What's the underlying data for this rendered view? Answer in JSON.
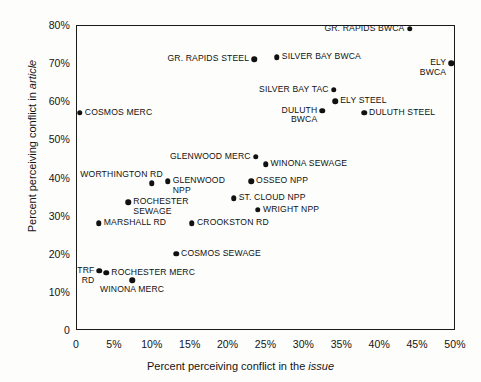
{
  "chart_data": {
    "type": "scatter",
    "title": "",
    "xlabel": "Percent perceiving conflict in the issue",
    "ylabel": "Percent perceiving conflict in article",
    "xlabel_plain": "Percent perceiving conflict in the",
    "xlabel_italic": "issue",
    "ylabel_plain": "Percent perceiving conflict in",
    "ylabel_italic": "article",
    "xlim": [
      0,
      50
    ],
    "ylim": [
      0,
      80
    ],
    "grid": false,
    "legend": "none",
    "xticks": [
      "0",
      "5%",
      "10%",
      "15%",
      "20%",
      "25%",
      "30%",
      "35%",
      "40%",
      "45%",
      "50%"
    ],
    "xtickvals": [
      0,
      5,
      10,
      15,
      20,
      25,
      30,
      35,
      40,
      45,
      50
    ],
    "yticks": [
      "0",
      "10%",
      "20%",
      "30%",
      "40%",
      "50%",
      "60%",
      "70%",
      "80%"
    ],
    "ytickvals": [
      0,
      10,
      20,
      30,
      40,
      50,
      60,
      70,
      80
    ],
    "marker_color": "#111111",
    "points": [
      {
        "label": "GR. RAPIDS BWCA",
        "x": 44.0,
        "y": 79.0,
        "pos": "l"
      },
      {
        "label": "GR. RAPIDS STEEL",
        "x": 23.5,
        "y": 71.0,
        "pos": "l"
      },
      {
        "label": "SILVER BAY BWCA",
        "x": 26.5,
        "y": 71.5,
        "pos": "r"
      },
      {
        "label": "ELY\nBWCA",
        "x": 49.5,
        "y": 70.0,
        "pos": "l2"
      },
      {
        "label": "SILVER BAY TAC",
        "x": 34.0,
        "y": 63.0,
        "pos": "l"
      },
      {
        "label": "ELY STEEL",
        "x": 34.2,
        "y": 60.0,
        "pos": "r"
      },
      {
        "label": "DULUTH\nBWCA",
        "x": 32.5,
        "y": 57.5,
        "pos": "l2"
      },
      {
        "label": "DULUTH STEEL",
        "x": 38.0,
        "y": 57.0,
        "pos": "r"
      },
      {
        "label": "COSMOS MERC",
        "x": 0.5,
        "y": 57.0,
        "pos": "r"
      },
      {
        "label": "GLENWOOD MERC",
        "x": 23.7,
        "y": 45.5,
        "pos": "l"
      },
      {
        "label": "WINONA SEWAGE",
        "x": 25.0,
        "y": 43.5,
        "pos": "r"
      },
      {
        "label": "WORTHINGTON RD",
        "x": 10.0,
        "y": 38.5,
        "pos": "lup"
      },
      {
        "label": "GLENWOOD\nNPP",
        "x": 12.1,
        "y": 39.0,
        "pos": "r2"
      },
      {
        "label": "OSSEO NPP",
        "x": 23.1,
        "y": 39.0,
        "pos": "r"
      },
      {
        "label": "ROCHESTER\nSEWAGE",
        "x": 6.9,
        "y": 33.5,
        "pos": "r2"
      },
      {
        "label": "ST. CLOUD NPP",
        "x": 20.8,
        "y": 34.5,
        "pos": "r"
      },
      {
        "label": "WRIGHT NPP",
        "x": 24.0,
        "y": 31.5,
        "pos": "r"
      },
      {
        "label": "MARSHALL RD",
        "x": 3.0,
        "y": 28.0,
        "pos": "r"
      },
      {
        "label": "CROOKSTON RD",
        "x": 15.3,
        "y": 28.0,
        "pos": "r"
      },
      {
        "label": "COSMOS SEWAGE",
        "x": 13.2,
        "y": 20.0,
        "pos": "r"
      },
      {
        "label": "TRF\nRD",
        "x": 3.1,
        "y": 15.5,
        "pos": "l2"
      },
      {
        "label": "ROCHESTER MERC",
        "x": 4.0,
        "y": 15.0,
        "pos": "r"
      },
      {
        "label": "WINONA MERC",
        "x": 7.4,
        "y": 13.0,
        "pos": "below"
      }
    ]
  }
}
